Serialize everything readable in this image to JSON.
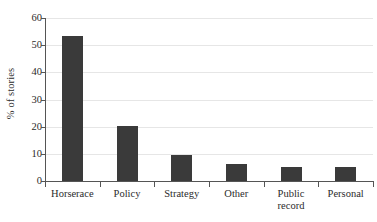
{
  "chart_data": {
    "type": "bar",
    "title": "",
    "xlabel": "",
    "ylabel": "% of stories",
    "categories": [
      "Horserace",
      "Policy",
      "Strategy",
      "Other",
      "Public record",
      "Personal"
    ],
    "category_lines": [
      [
        "Horserace"
      ],
      [
        "Policy"
      ],
      [
        "Strategy"
      ],
      [
        "Other"
      ],
      [
        "Public",
        "record"
      ],
      [
        "Personal"
      ]
    ],
    "values": [
      53.2,
      20.4,
      9.7,
      6.3,
      5.3,
      5.3
    ],
    "ylim": [
      0,
      60
    ],
    "ytick_labels": [
      "0",
      "10",
      "20",
      "30",
      "40",
      "50",
      "60"
    ],
    "ytick_values": [
      0,
      10,
      20,
      30,
      40,
      50,
      60
    ],
    "grid": "horizontal",
    "legend": "none",
    "bar_color": "#3a3a3a",
    "grid_color": "#e6e6e6",
    "axis_color": "#555555",
    "background_color": "#ffffff"
  }
}
